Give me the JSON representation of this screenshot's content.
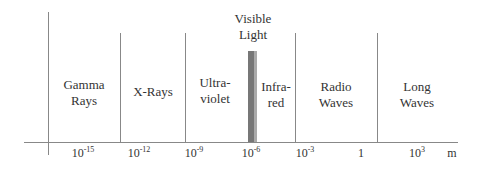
{
  "diagram": {
    "regions": [
      {
        "label_line1": "Gamma",
        "label_line2": "Rays"
      },
      {
        "label_line1": "X-Rays",
        "label_line2": ""
      },
      {
        "label_line1": "Ultra-",
        "label_line2": "violet"
      },
      {
        "label_line1": "Visible",
        "label_line2": "Light"
      },
      {
        "label_line1": "Infra-",
        "label_line2": "red"
      },
      {
        "label_line1": "Radio",
        "label_line2": "Waves"
      },
      {
        "label_line1": "Long",
        "label_line2": "Waves"
      }
    ],
    "ticks": [
      {
        "base": "10",
        "exp": "-15"
      },
      {
        "base": "10",
        "exp": "-12"
      },
      {
        "base": "10",
        "exp": "-9"
      },
      {
        "base": "10",
        "exp": "-6"
      },
      {
        "base": "10",
        "exp": "-3"
      },
      {
        "base": "1",
        "exp": ""
      },
      {
        "base": "10",
        "exp": "3"
      }
    ],
    "unit": "m",
    "colors": {
      "line": "#888888",
      "text": "#333333",
      "visible_bar_dark": "#777777",
      "visible_bar_light": "#aaaaaa"
    }
  }
}
